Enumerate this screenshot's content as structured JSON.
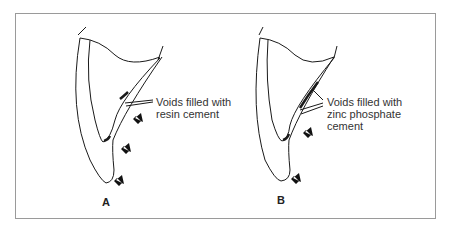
{
  "panels": [
    {
      "label": "A",
      "annotation_line1": "Voids filled with",
      "annotation_line2": "resin cement"
    },
    {
      "label": "B",
      "annotation_line1": "Voids filled with",
      "annotation_line2": "zinc phosphate",
      "annotation_line3": "cement"
    }
  ],
  "colors": {
    "frame": "#9a9a9a",
    "stroke": "#1a1a1a",
    "text": "#333333"
  }
}
